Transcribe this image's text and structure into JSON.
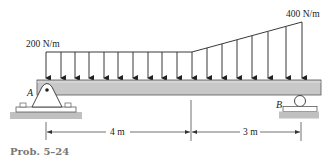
{
  "figure": {
    "caption": "Prob. 5–24",
    "beam": {
      "fill": "#c8c8c8",
      "stroke": "#555555"
    },
    "loads": {
      "left_intensity_label": "200 N/m",
      "right_intensity_label": "400 N/m",
      "left_intensity": 200,
      "right_intensity": 400,
      "unit": "N/m",
      "description": "Uniform 200 N/m over first 4 m, then linearly increasing to 400 N/m over last 3 m"
    },
    "supports": {
      "A": {
        "label": "A",
        "type": "pin"
      },
      "B": {
        "label": "B",
        "type": "roller"
      }
    },
    "dimensions": [
      {
        "label": "4 m",
        "length": 4,
        "unit": "m"
      },
      {
        "label": "3 m",
        "length": 3,
        "unit": "m"
      }
    ]
  }
}
